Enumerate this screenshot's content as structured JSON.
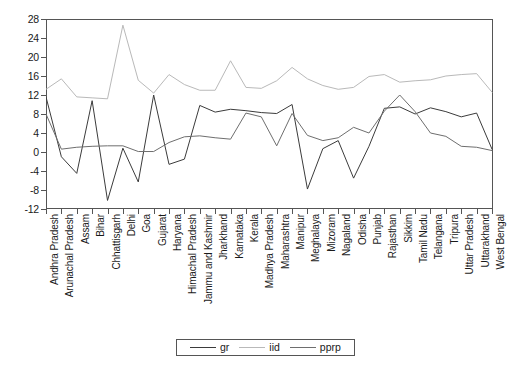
{
  "chart_data": {
    "type": "line",
    "title": "",
    "xlabel": "",
    "ylabel": "",
    "ylim": [
      -12,
      28
    ],
    "ytick_step": 4,
    "yticks": [
      28,
      24,
      20,
      16,
      12,
      8,
      4,
      0,
      -4,
      -8,
      -12
    ],
    "grid": false,
    "legend_position": "bottom",
    "categories": [
      "Andhra Pradesh",
      "Arunachal Pradesh",
      "Assam",
      "Bihar",
      "Chhattisgarh",
      "Delhi",
      "Goa",
      "Gujarat",
      "Haryana",
      "Himachal Pradesh",
      "Jammu and Kashmir",
      "Jharkhand",
      "Karnataka",
      "Kerala",
      "Madhya Pradesh",
      "Maharashtra",
      "Manipur",
      "Meghalaya",
      "Mizoram",
      "Nagaland",
      "Odisha",
      "Punjab",
      "Rajasthan",
      "Sikkim",
      "Tamil Nadu",
      "Telangana",
      "Tripura",
      "Uttar Pradesh",
      "Uttarakhand",
      "West Bengal"
    ],
    "series": [
      {
        "name": "gr",
        "color": "#3b3b3b",
        "values": [
          11.6,
          -1.0,
          -4.5,
          10.8,
          -10.2,
          0.8,
          -6.3,
          12.0,
          -2.6,
          -1.5,
          9.8,
          8.4,
          9.0,
          8.7,
          8.3,
          8.1,
          10.0,
          -7.8,
          0.7,
          2.4,
          -5.5,
          1.2,
          9.2,
          9.5,
          8.0,
          9.3,
          8.5,
          7.4,
          8.2,
          0.6
        ]
      },
      {
        "name": "iid",
        "color": "#b9b9b9",
        "values": [
          13.2,
          15.4,
          11.6,
          11.4,
          11.2,
          26.7,
          15.1,
          12.4,
          16.3,
          14.2,
          13.0,
          13.0,
          19.2,
          13.6,
          13.4,
          15.0,
          17.8,
          15.4,
          14.0,
          13.2,
          13.6,
          15.9,
          16.3,
          14.7,
          15.0,
          15.2,
          16.0,
          16.3,
          16.5,
          12.6
        ]
      },
      {
        "name": "pprp",
        "color": "#6e6e6e",
        "values": [
          8.0,
          0.6,
          1.0,
          1.2,
          1.3,
          1.3,
          0.1,
          0.1,
          2.0,
          3.2,
          3.4,
          3.0,
          2.7,
          8.2,
          7.4,
          1.3,
          8.1,
          3.5,
          2.4,
          3.0,
          5.2,
          4.0,
          8.6,
          12.0,
          8.5,
          4.0,
          3.3,
          1.2,
          1.0,
          0.3
        ]
      }
    ]
  },
  "legend": {
    "entries": [
      {
        "label": "gr",
        "color": "#3b3b3b"
      },
      {
        "label": "iid",
        "color": "#b9b9b9"
      },
      {
        "label": "pprp",
        "color": "#6e6e6e"
      }
    ]
  },
  "axis": {
    "y_labels": [
      "28",
      "24",
      "20",
      "16",
      "12",
      "8",
      "4",
      "0",
      "-4",
      "-8",
      "-12"
    ]
  }
}
